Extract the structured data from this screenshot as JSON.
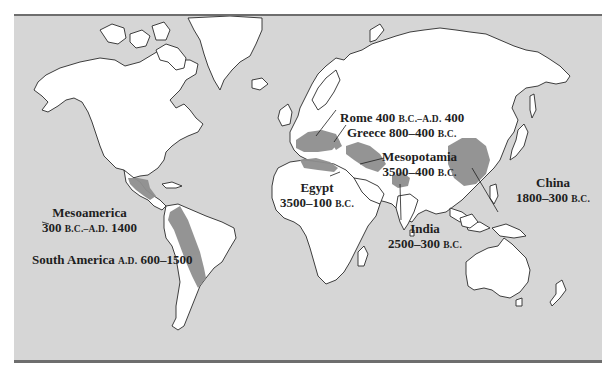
{
  "map": {
    "colors": {
      "ocean": "#d6d6d6",
      "land": "#ffffff",
      "region": "#8f8f8f",
      "coast": "#2a2a2a",
      "rule": "#6e6e6e",
      "text": "#1e1e1e"
    },
    "regions": [
      {
        "id": "rome",
        "name": "Rome",
        "dates_main": "400 ",
        "dates_sc": "B.C.–A.D.",
        "dates_end": " 400"
      },
      {
        "id": "greece",
        "name": "Greece",
        "dates_main": "800–400 ",
        "dates_sc": "B.C."
      },
      {
        "id": "mesopotamia",
        "name": "Mesopotamia",
        "dates_main": "3500–400 ",
        "dates_sc": "B.C."
      },
      {
        "id": "egypt",
        "name": "Egypt",
        "dates_main": "3500–100 ",
        "dates_sc": "B.C."
      },
      {
        "id": "india",
        "name": "India",
        "dates_main": "2500–300 ",
        "dates_sc": "B.C."
      },
      {
        "id": "china",
        "name": "China",
        "dates_main": "1800–300 ",
        "dates_sc": "B.C."
      },
      {
        "id": "mesoamerica",
        "name": "Mesoamerica",
        "dates_main": "300 ",
        "dates_sc": "B.C.–A.D.",
        "dates_end": " 1400"
      },
      {
        "id": "south-america",
        "name": "South America",
        "dates_sc": "A.D.",
        "dates_main": " 600–1500"
      }
    ]
  }
}
